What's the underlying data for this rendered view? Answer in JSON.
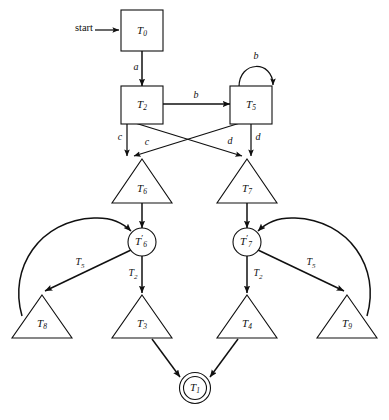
{
  "diagram": {
    "kind": "state-machine",
    "title": "",
    "background_color": "#ffffff",
    "stroke_color": "#101010",
    "start_label": "start"
  },
  "nodes": {
    "t0": {
      "name": "T",
      "sub": "0",
      "prime": "",
      "shape": "box"
    },
    "t2": {
      "name": "T",
      "sub": "2",
      "prime": "",
      "shape": "box"
    },
    "t5": {
      "name": "T",
      "sub": "5",
      "prime": "",
      "shape": "box"
    },
    "t6": {
      "name": "T",
      "sub": "6",
      "prime": "",
      "shape": "triangle"
    },
    "t7": {
      "name": "T",
      "sub": "7",
      "prime": "",
      "shape": "triangle"
    },
    "t6p": {
      "name": "T",
      "sub": "6",
      "prime": "′",
      "shape": "circle"
    },
    "t7p": {
      "name": "T",
      "sub": "7",
      "prime": "′",
      "shape": "circle"
    },
    "t8": {
      "name": "T",
      "sub": "8",
      "prime": "",
      "shape": "triangle"
    },
    "t3": {
      "name": "T",
      "sub": "3",
      "prime": "",
      "shape": "triangle"
    },
    "t4": {
      "name": "T",
      "sub": "4",
      "prime": "",
      "shape": "triangle"
    },
    "t9": {
      "name": "T",
      "sub": "9",
      "prime": "",
      "shape": "triangle"
    },
    "t1": {
      "name": "T",
      "sub": "1",
      "prime": "",
      "shape": "double-circle"
    }
  },
  "edge_labels": {
    "t0_t2": {
      "text": "a",
      "sub": ""
    },
    "t2_t5": {
      "text": "b",
      "sub": ""
    },
    "t5_self": {
      "text": "b",
      "sub": ""
    },
    "t2_t6": {
      "text": "c",
      "sub": ""
    },
    "t5_t6": {
      "text": "c",
      "sub": ""
    },
    "t2_t7": {
      "text": "d",
      "sub": ""
    },
    "t5_t7": {
      "text": "d",
      "sub": ""
    },
    "t6p_t8": {
      "text": "T",
      "sub": "5"
    },
    "t6p_t3": {
      "text": "T",
      "sub": "2"
    },
    "t7p_t4": {
      "text": "T",
      "sub": "2"
    },
    "t7p_t9": {
      "text": "T",
      "sub": "5"
    }
  },
  "edges": [
    {
      "id": "start_t0",
      "from": "start",
      "to": "t0",
      "label_key": "",
      "style": "straight"
    },
    {
      "id": "t0_t2",
      "from": "t0",
      "to": "t2",
      "label_key": "t0_t2",
      "style": "straight"
    },
    {
      "id": "t2_t5",
      "from": "t2",
      "to": "t5",
      "label_key": "t2_t5",
      "style": "straight"
    },
    {
      "id": "t5_self",
      "from": "t5",
      "to": "t5",
      "label_key": "t5_self",
      "style": "self-loop"
    },
    {
      "id": "t2_t6",
      "from": "t2",
      "to": "t6",
      "label_key": "t2_t6",
      "style": "straight"
    },
    {
      "id": "t5_t6",
      "from": "t5",
      "to": "t6",
      "label_key": "t5_t6",
      "style": "crossing"
    },
    {
      "id": "t2_t7",
      "from": "t2",
      "to": "t7",
      "label_key": "t2_t7",
      "style": "crossing"
    },
    {
      "id": "t5_t7",
      "from": "t5",
      "to": "t7",
      "label_key": "t5_t7",
      "style": "straight"
    },
    {
      "id": "t6_t6p",
      "from": "t6",
      "to": "t6p",
      "label_key": "",
      "style": "straight"
    },
    {
      "id": "t7_t7p",
      "from": "t7",
      "to": "t7p",
      "label_key": "",
      "style": "straight"
    },
    {
      "id": "t6p_t8",
      "from": "t6p",
      "to": "t8",
      "label_key": "t6p_t8",
      "style": "straight"
    },
    {
      "id": "t6p_t3",
      "from": "t6p",
      "to": "t3",
      "label_key": "t6p_t3",
      "style": "straight"
    },
    {
      "id": "t8_t6p",
      "from": "t8",
      "to": "t6p",
      "label_key": "",
      "style": "arc"
    },
    {
      "id": "t7p_t4",
      "from": "t7p",
      "to": "t4",
      "label_key": "t7p_t4",
      "style": "straight"
    },
    {
      "id": "t7p_t9",
      "from": "t7p",
      "to": "t9",
      "label_key": "t7p_t9",
      "style": "straight"
    },
    {
      "id": "t9_t7p",
      "from": "t9",
      "to": "t7p",
      "label_key": "",
      "style": "arc"
    },
    {
      "id": "t3_t1",
      "from": "t3",
      "to": "t1",
      "label_key": "",
      "style": "straight"
    },
    {
      "id": "t4_t1",
      "from": "t4",
      "to": "t1",
      "label_key": "",
      "style": "straight"
    }
  ]
}
